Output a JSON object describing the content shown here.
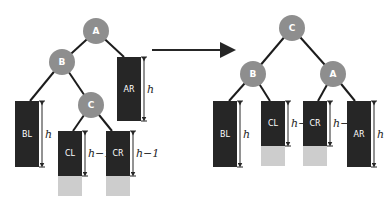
{
  "diagram": {
    "arrow": {
      "from": "before",
      "to": "after"
    },
    "before": {
      "nodes": [
        {
          "id": "A",
          "label": "A",
          "cx": 96,
          "cy": 31
        },
        {
          "id": "B",
          "label": "B",
          "cx": 62,
          "cy": 62
        },
        {
          "id": "C",
          "label": "C",
          "cx": 91,
          "cy": 105
        }
      ],
      "subtrees": [
        {
          "id": "AR",
          "label": "AR",
          "x": 117,
          "y": 57,
          "w": 24,
          "h": 64,
          "ghost_h": 0,
          "dim_label": "h"
        },
        {
          "id": "BL",
          "label": "BL",
          "x": 15,
          "y": 101,
          "w": 24,
          "h": 66,
          "ghost_h": 0,
          "dim_label": "h"
        },
        {
          "id": "CL",
          "label": "CL",
          "x": 58,
          "y": 131,
          "w": 24,
          "h": 45,
          "ghost_h": 20,
          "dim_label": "h−1"
        },
        {
          "id": "CR",
          "label": "CR",
          "x": 106,
          "y": 131,
          "w": 24,
          "h": 45,
          "ghost_h": 20,
          "dim_label": "h−1"
        }
      ]
    },
    "after": {
      "nodes": [
        {
          "id": "C",
          "label": "C",
          "cx": 292,
          "cy": 28
        },
        {
          "id": "B",
          "label": "B",
          "cx": 253,
          "cy": 74
        },
        {
          "id": "A",
          "label": "A",
          "cx": 333,
          "cy": 74
        }
      ],
      "subtrees": [
        {
          "id": "BL",
          "label": "BL",
          "x": 213,
          "y": 101,
          "w": 24,
          "h": 66,
          "ghost_h": 0,
          "dim_label": "h"
        },
        {
          "id": "CL",
          "label": "CL",
          "x": 261,
          "y": 101,
          "w": 24,
          "h": 45,
          "ghost_h": 20,
          "dim_label": "h−1"
        },
        {
          "id": "CR",
          "label": "CR",
          "x": 303,
          "y": 101,
          "w": 24,
          "h": 45,
          "ghost_h": 20,
          "dim_label": "h−1"
        },
        {
          "id": "AR",
          "label": "AR",
          "x": 347,
          "y": 101,
          "w": 24,
          "h": 66,
          "ghost_h": 0,
          "dim_label": "h"
        }
      ]
    },
    "colors": {
      "node": "#8e8e8e",
      "subtree": "#262626",
      "ghost": "#cdcdcd",
      "edge": "#1c1c1c"
    }
  }
}
